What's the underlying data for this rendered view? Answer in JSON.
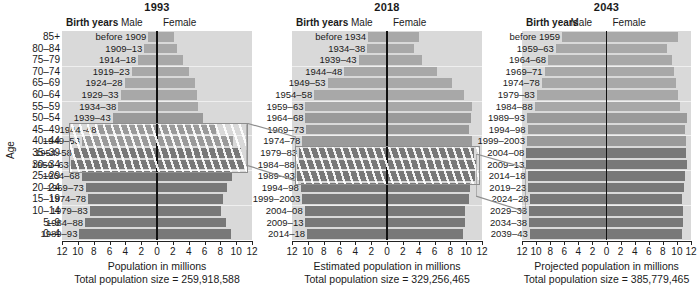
{
  "axis": {
    "age_title": "Age",
    "age_groups": [
      "85+",
      "80–84",
      "75–79",
      "70–74",
      "65–69",
      "60–64",
      "55–59",
      "50–54",
      "45–49",
      "40–44",
      "35–39",
      "30–34",
      "25–29",
      "20–24",
      "15–19",
      "10–14",
      "5–9",
      "0–4"
    ],
    "xticks": [
      "12",
      "10",
      "8",
      "6",
      "4",
      "2",
      "0",
      "2",
      "4",
      "6",
      "8",
      "10",
      "12"
    ],
    "xlim": [
      -12,
      12
    ]
  },
  "legend": {
    "birth_years": "Birth years",
    "male": "Male",
    "female": "Female"
  },
  "colors": {
    "plot_background": "#d9d9d9",
    "bar_light": "#a8a8a8",
    "bar_mid": "#9a9a9a",
    "bar_dark": "#787878",
    "centerline": "#111111",
    "highlight_outline": "#8e8e8e"
  },
  "chart_data": {
    "type": "bar",
    "xlabel": "Population in millions",
    "ylabel": "Age",
    "grid": true,
    "legend_position": "top",
    "xlim": [
      -12,
      12
    ],
    "categories": [
      "85+",
      "80–84",
      "75–79",
      "70–74",
      "65–69",
      "60–64",
      "55–59",
      "50–54",
      "45–49",
      "40–44",
      "35–39",
      "30–34",
      "25–29",
      "20–24",
      "15–19",
      "10–14",
      "5–9",
      "0–4"
    ],
    "panels": [
      {
        "title": "1993",
        "xlabel": "Population in millions",
        "total_label": "Total population size = 259,918,588",
        "total_value": 259918588,
        "birth_years": [
          "before 1909",
          "1909–13",
          "1914–18",
          "1919–23",
          "1924–28",
          "1929–33",
          "1934–38",
          "1939–43",
          "1944–48",
          "1949–53",
          "1954–58",
          "1959–63",
          "1964–68",
          "1969–73",
          "1974–78",
          "1979–83",
          "1984–88",
          "1989–93"
        ],
        "male": [
          1.1,
          1.6,
          2.4,
          3.2,
          4.1,
          4.6,
          4.9,
          5.6,
          7.4,
          9.5,
          10.5,
          10.9,
          9.5,
          9.0,
          8.7,
          8.5,
          9.1,
          9.8
        ],
        "female": [
          2.1,
          2.5,
          3.3,
          4.0,
          4.8,
          5.1,
          5.2,
          5.8,
          7.5,
          9.6,
          10.6,
          11.0,
          9.5,
          8.9,
          8.3,
          8.1,
          8.7,
          9.4
        ],
        "highlight": {
          "from_index": 8,
          "to_index": 11,
          "birth_years": [
            "1944–48",
            "1949–53",
            "1954–58",
            "1959–63"
          ]
        }
      },
      {
        "title": "2018",
        "xlabel": "Estimated population in millions",
        "total_label": "Total population size = 329,256,465",
        "total_value": 329256465,
        "birth_years": [
          "before 1934",
          "1934–38",
          "1939–43",
          "1944–48",
          "1949–53",
          "1954–58",
          "1959–63",
          "1964–68",
          "1969–73",
          "1974–78",
          "1979–83",
          "1984–88",
          "1989–93",
          "1994–98",
          "1999–2003",
          "2004–08",
          "2009–13",
          "2014–18"
        ],
        "male": [
          2.4,
          2.5,
          3.6,
          5.4,
          7.5,
          9.2,
          10.3,
          10.3,
          10.2,
          10.7,
          11.1,
          11.4,
          11.4,
          10.9,
          10.7,
          10.4,
          10.3,
          10.1
        ],
        "female": [
          4.1,
          3.4,
          4.4,
          6.3,
          8.2,
          9.7,
          10.7,
          10.6,
          10.4,
          10.7,
          11.0,
          11.2,
          11.1,
          10.5,
          10.3,
          9.9,
          9.8,
          9.6
        ],
        "highlight": {
          "from_index": 10,
          "to_index": 12,
          "birth_years": [
            "1979–83",
            "1984–88",
            "1989–93"
          ]
        }
      },
      {
        "title": "2043",
        "xlabel": "Projected population in millions",
        "total_label": "Total population size = 385,779,465",
        "total_value": 385779465,
        "birth_years": [
          "before 1959",
          "1959–63",
          "1964–68",
          "1969–71",
          "1974–78",
          "1979–83",
          "1984–88",
          "1989–93",
          "1994–98",
          "1999–2003",
          "2004–08",
          "2009–13",
          "2014–18",
          "2019–23",
          "2024–28",
          "2029–33",
          "2034–38",
          "2039–43"
        ],
        "male": [
          6.3,
          7.2,
          8.3,
          8.8,
          9.2,
          9.9,
          10.2,
          11.3,
          11.2,
          11.3,
          11.4,
          11.4,
          11.2,
          11.1,
          10.8,
          11.0,
          11.0,
          10.9
        ],
        "female": [
          10.1,
          8.6,
          9.3,
          9.6,
          9.8,
          10.2,
          10.4,
          11.4,
          11.2,
          11.3,
          11.3,
          11.5,
          11.2,
          11.0,
          10.7,
          10.9,
          10.8,
          10.7
        ],
        "highlight": null
      }
    ]
  }
}
